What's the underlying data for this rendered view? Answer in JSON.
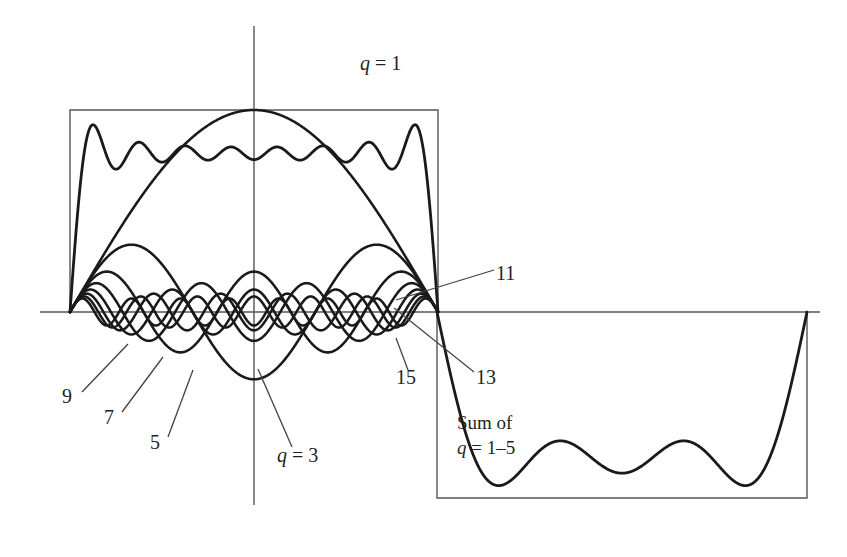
{
  "figure": {
    "background_color": "#ffffff",
    "ink_color": "#231f20",
    "curve_color": "#1a1a1a",
    "axis_color": "#555555"
  },
  "labels": {
    "q1": "q = 1",
    "q3": "q = 3",
    "n5": "5",
    "n7": "7",
    "n9": "9",
    "n11": "11",
    "n13": "13",
    "n15": "15",
    "sum_line1": "Sum of",
    "sum_line2": "q = 1–5"
  },
  "chart_data": {
    "type": "line",
    "xlabel": "",
    "ylabel": "",
    "grid": false,
    "legend": "inline-annotations",
    "axes": {
      "x_axis_y_px": 312,
      "y_axis_x_px": 254,
      "x_range_px": [
        40,
        820
      ],
      "note": "Unlabeled axes; amplitude in arbitrary units"
    },
    "square_wave": {
      "description": "Ideal square wave: positive half-cycle at left, negative half-cycle at right",
      "positive_box": {
        "x0": 70,
        "x1": 438,
        "y_top": 110,
        "y_base": 312
      },
      "negative_box": {
        "x0": 437,
        "x1": 807,
        "y_top": 312,
        "y_base": 498
      }
    },
    "series": [
      {
        "name": "q = 1",
        "harmonic": 1,
        "amplitude": 1.0,
        "label": "q = 1"
      },
      {
        "name": "q = 3",
        "harmonic": 3,
        "amplitude": 0.3333,
        "label": "q = 3"
      },
      {
        "name": "q = 5",
        "harmonic": 5,
        "amplitude": 0.2,
        "label": "5"
      },
      {
        "name": "q = 7",
        "harmonic": 7,
        "amplitude": 0.1429,
        "label": "7"
      },
      {
        "name": "q = 9",
        "harmonic": 9,
        "amplitude": 0.1111,
        "label": "9"
      },
      {
        "name": "q = 11",
        "harmonic": 11,
        "amplitude": 0.0909,
        "label": "11"
      },
      {
        "name": "q = 13",
        "harmonic": 13,
        "amplitude": 0.0769,
        "label": "13"
      },
      {
        "name": "q = 15",
        "harmonic": 15,
        "amplitude": 0.0667,
        "label": "15"
      },
      {
        "name": "Sum of q = 1-5",
        "harmonic": "1,3,5 partial sum",
        "amplitude": 1.0,
        "label": "Sum of q = 1–5"
      }
    ],
    "partial_sum_top": {
      "description": "Ripply partial-sum curve riding on top of the positive half-cycle",
      "terms": [
        1,
        3,
        5,
        7,
        9,
        11,
        13,
        15
      ]
    },
    "partial_sum_bottom": {
      "description": "Partial sum of q = 1–5 drawn inside the negative half-cycle box",
      "terms": [
        1,
        3,
        5
      ]
    }
  }
}
